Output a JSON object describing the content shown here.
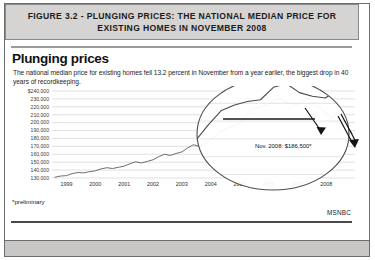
{
  "figure": {
    "caption": "FIGURE 3.2 - PLUNGING PRICES: THE NATIONAL MEDIAN PRICE FOR EXISTING HOMES IN NOVEMBER 2008"
  },
  "chart_header": {
    "title": "Plunging prices",
    "subtitle": "The national median price for existing homes fell 13.2 percent in November from a year earlier, the biggest drop in 40 years of recordkeeping.",
    "footnote": "*preliminary",
    "source": "MSNBC"
  },
  "chart_data": {
    "type": "line",
    "title": "Plunging prices",
    "subtitle": "The national median price for existing homes fell 13.2 percent in November from a year earlier, the biggest drop in 40 years of recordkeeping.",
    "xlabel": "",
    "ylabel": "",
    "ylim": [
      130000,
      240000
    ],
    "xlim": [
      1998.5,
      2009.0
    ],
    "grid": true,
    "legend": false,
    "ytick_labels": [
      "$240,000",
      "230,000",
      "220,000",
      "210,000",
      "200,000",
      "190,000",
      "180,000",
      "170,000",
      "160,000",
      "150,000",
      "140,000",
      "130,000"
    ],
    "ytick_values": [
      240000,
      230000,
      220000,
      210000,
      200000,
      190000,
      180000,
      170000,
      160000,
      150000,
      140000,
      130000
    ],
    "xtick_labels": [
      "1999",
      "2000",
      "2001",
      "2002",
      "2003",
      "2004",
      "2005",
      "2006",
      "2007",
      "2008"
    ],
    "xtick_values": [
      1999,
      2000,
      2001,
      2002,
      2003,
      2004,
      2005,
      2006,
      2007,
      2008
    ],
    "series": [
      {
        "name": "National median price for existing homes",
        "x": [
          1998.6,
          1998.8,
          1999.0,
          1999.2,
          1999.4,
          1999.6,
          1999.8,
          2000.0,
          2000.2,
          2000.4,
          2000.6,
          2000.8,
          2001.0,
          2001.2,
          2001.4,
          2001.6,
          2001.8,
          2002.0,
          2002.2,
          2002.4,
          2002.6,
          2002.8,
          2003.0,
          2003.2,
          2003.4,
          2003.6,
          2003.8,
          2004.0,
          2004.2,
          2004.4,
          2004.6,
          2004.8,
          2005.0,
          2005.2,
          2005.4,
          2005.6,
          2005.8,
          2006.0,
          2006.2,
          2006.4,
          2006.6,
          2006.8,
          2007.0,
          2007.2,
          2007.4,
          2007.6,
          2007.8,
          2008.0,
          2008.2,
          2008.4,
          2008.6,
          2008.75,
          2008.9
        ],
        "y": [
          131000,
          132500,
          133000,
          135500,
          137000,
          136500,
          138000,
          139000,
          141500,
          143000,
          142000,
          143500,
          145000,
          148000,
          150500,
          149000,
          151000,
          153000,
          157000,
          160000,
          158500,
          161000,
          163000,
          168000,
          172000,
          170000,
          174000,
          178000,
          184000,
          190000,
          193000,
          196000,
          199000,
          208000,
          216000,
          219000,
          221000,
          222000,
          229000,
          231000,
          226000,
          224000,
          223000,
          228000,
          230000,
          222000,
          218000,
          212000,
          206000,
          215000,
          203000,
          194000,
          186500
        ]
      }
    ],
    "annotations": [
      {
        "name": "nov-2008-callout",
        "text": "Nov. 2008: $186,500*",
        "x": 2008.9,
        "y": 186500
      }
    ],
    "magnifier": {
      "type": "ellipse-callout",
      "description": "Magnifying lens highlighting the 2005-2008 decline",
      "arrows": 2
    }
  },
  "colors": {
    "line": "#4a4a4a",
    "grid": "#d2d2d2",
    "header_bg": "#d6d4d2",
    "footer_bg": "#c9c7c5",
    "frame": "#6d6d6d",
    "text": "#111111"
  }
}
